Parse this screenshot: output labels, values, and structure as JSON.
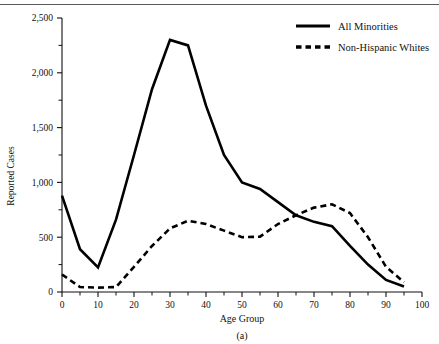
{
  "chart_data": {
    "type": "line",
    "title": "",
    "xlabel": "Age Group",
    "ylabel": "Reported Cases",
    "caption": "(a)",
    "xlim": [
      0,
      100
    ],
    "ylim": [
      0,
      2500
    ],
    "grid": false,
    "legend_position": "top-right",
    "x": [
      0,
      5,
      10,
      15,
      20,
      25,
      30,
      35,
      40,
      45,
      50,
      55,
      60,
      65,
      70,
      75,
      80,
      85,
      90,
      95
    ],
    "xticks": [
      0,
      10,
      20,
      30,
      40,
      50,
      60,
      70,
      80,
      90,
      100
    ],
    "xticklabels": [
      "0",
      "10",
      "20",
      "30",
      "40",
      "50",
      "60",
      "70",
      "80",
      "90",
      "100"
    ],
    "xticks_minor": [
      5,
      15,
      25,
      35,
      45,
      55,
      65,
      75,
      85,
      95
    ],
    "yticks": [
      0,
      500,
      1000,
      1500,
      2000,
      2500
    ],
    "yticklabels": [
      "0",
      "500",
      "1,000",
      "1,500",
      "2,000",
      "2,500"
    ],
    "yticks_minor": [
      250,
      750,
      1250,
      1750,
      2250
    ],
    "series": [
      {
        "name": "All Minorities",
        "style": "solid",
        "color": "#000000",
        "values": [
          880,
          390,
          225,
          660,
          1250,
          1850,
          2300,
          2250,
          1700,
          1250,
          1000,
          940,
          820,
          700,
          640,
          600,
          420,
          250,
          110,
          50
        ]
      },
      {
        "name": "Non-Hispanic Whites",
        "style": "dashed",
        "color": "#000000",
        "values": [
          160,
          45,
          40,
          45,
          230,
          420,
          580,
          650,
          620,
          560,
          500,
          505,
          620,
          700,
          770,
          800,
          720,
          500,
          230,
          90
        ]
      }
    ]
  }
}
